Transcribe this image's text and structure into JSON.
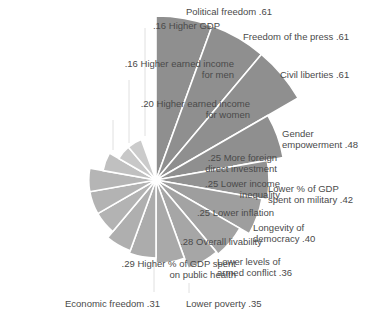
{
  "chart_data": {
    "type": "polar-area",
    "title": "",
    "center": [
      156,
      180
    ],
    "px_per_unit": 269,
    "wedge_degrees": 20,
    "start_angle_deg": 0,
    "direction": "clockwise",
    "categories": [
      "Political freedom",
      "Freedom of the press",
      "Civil liberties",
      "Gender empowerment",
      "Lower % of GDP spent on military",
      "Longevity of democracy",
      "Lower levels of armed conflict",
      "Lower poverty",
      "Economic freedom",
      "Higher % of GDP spent on public health",
      "Overall livability",
      "Lower inflation",
      "Lower income inequality",
      "More foreign direct investment",
      "Higher earned income for women",
      "Higher earned income for men",
      "Higher GDP"
    ],
    "values": [
      0.61,
      0.61,
      0.61,
      0.48,
      0.42,
      0.4,
      0.36,
      0.35,
      0.31,
      0.29,
      0.28,
      0.25,
      0.25,
      0.25,
      0.2,
      0.16,
      0.16
    ],
    "colors": [
      "#8f8f8f",
      "#8f8f8f",
      "#8f8f8f",
      "#8f8f8f",
      "#929292",
      "#9e9e9e",
      "#a3a3a3",
      "#a6a6a6",
      "#a9a9a9",
      "#acacac",
      "#afafaf",
      "#b3b3b3",
      "#b3b3b3",
      "#b5b5b5",
      "#c0c0c0",
      "#c8c8c8",
      "#cbcbcb"
    ],
    "labels": [
      {
        "text": "Political freedom  .61",
        "x": 186,
        "y": 6,
        "align": "left"
      },
      {
        "text": "Freedom of the press  .61",
        "x": 243,
        "y": 31,
        "align": "left"
      },
      {
        "text": "Civil liberties  .61",
        "x": 280,
        "y": 69,
        "align": "left"
      },
      {
        "text": "Gender\nempowerment  .48",
        "x": 282,
        "y": 128,
        "align": "left"
      },
      {
        "text": "Lower % of GDP\nspent on military  .42",
        "x": 268,
        "y": 183,
        "align": "left"
      },
      {
        "text": "Longevity of\ndemocracy  .40",
        "x": 253,
        "y": 222,
        "align": "left"
      },
      {
        "text": "Lower levels of\narmed conflict  .36",
        "x": 217,
        "y": 256,
        "align": "left"
      },
      {
        "text": "Lower poverty  .35",
        "x": 186,
        "y": 298,
        "align": "left"
      },
      {
        "text": "Economic freedom  .31",
        "x": 65,
        "y": 298,
        "align": "left"
      },
      {
        "text": ".29  Higher % of GDP spent\non public health",
        "right": 236,
        "y": 258,
        "align": "right"
      },
      {
        "text": ".28  Overall livability",
        "right": 262,
        "y": 236,
        "align": "right"
      },
      {
        "text": ".25  Lower inflation",
        "right": 274,
        "y": 207,
        "align": "right"
      },
      {
        "text": ".25  Lower income\ninequality",
        "right": 280,
        "y": 178,
        "align": "right"
      },
      {
        "text": ".25  More foreign\ndirect investment",
        "right": 277,
        "y": 152,
        "align": "right"
      },
      {
        "text": ".20  Higher earned income\nfor women",
        "right": 250,
        "y": 98,
        "align": "right"
      },
      {
        "text": ".16  Higher earned income\nfor men",
        "right": 234,
        "y": 58,
        "align": "right"
      },
      {
        "text": ".16  Higher GDP",
        "right": 220,
        "y": 20,
        "align": "right"
      }
    ],
    "leader_lines": [
      {
        "x": 145,
        "y1": 28,
        "y2": 136
      },
      {
        "x": 129,
        "y1": 80,
        "y2": 143
      },
      {
        "x": 113,
        "y1": 120,
        "y2": 150
      },
      {
        "x": 154,
        "y1": 262,
        "y2": 292
      },
      {
        "x": 189,
        "y1": 283,
        "y2": 293
      }
    ],
    "xlabel": "",
    "ylabel": "",
    "legend": null,
    "grid": false
  }
}
